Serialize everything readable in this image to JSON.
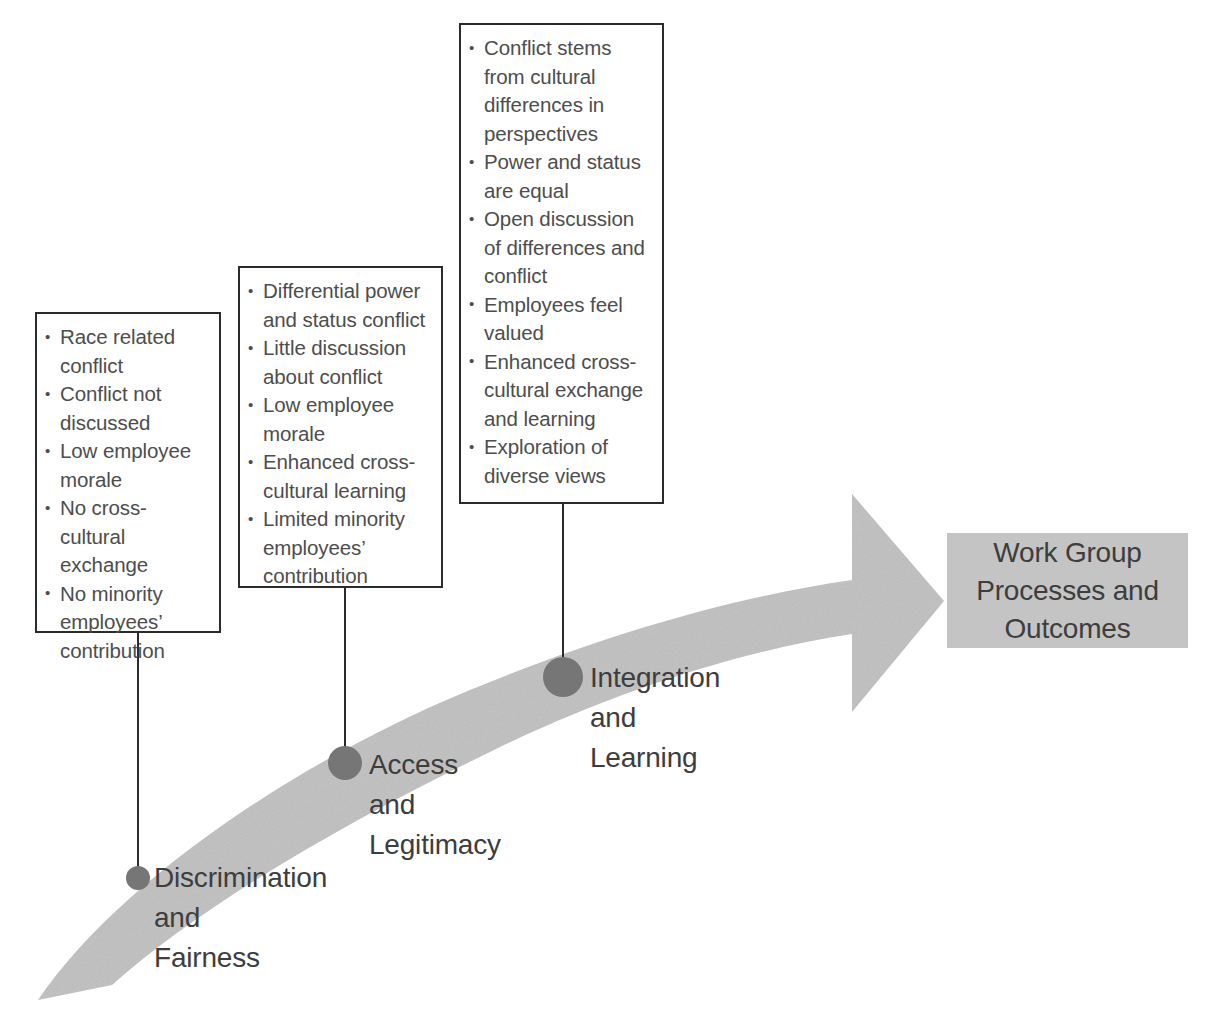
{
  "diagram": {
    "arrow": {
      "name": "curved-progress-arrow",
      "color": "#c4c4c4",
      "direction": "bottom-left to right, ascending"
    },
    "stages": [
      {
        "id": "discrimination-and-fairness",
        "label": "Discrimination\nand\nFairness",
        "dot_color": "#767676",
        "callout": {
          "items": [
            "Race related conflict",
            "Conflict not discussed",
            "Low employee morale",
            "No cross-cultural exchange",
            "No minority employees’ contribution"
          ]
        }
      },
      {
        "id": "access-and-legitimacy",
        "label": "Access\nand\nLegitimacy",
        "dot_color": "#767676",
        "callout": {
          "items": [
            "Differential power and status conflict",
            "Little discussion about conflict",
            "Low employee morale",
            "Enhanced cross-cultural learning",
            "Limited minority employees’ contribution"
          ]
        }
      },
      {
        "id": "integration-and-learning",
        "label": "Integration\nand\nLearning",
        "dot_color": "#767676",
        "callout": {
          "items": [
            "Conflict stems from cultural differences in perspectives",
            "Power and status are equal",
            "Open discussion of differences and conflict",
            "Employees feel valued",
            "Enhanced cross-cultural exchange and learning",
            "Exploration of diverse views"
          ]
        }
      }
    ],
    "outcome": {
      "id": "work-group-outcome",
      "label": "Work Group\nProcesses and\nOutcomes",
      "background": "#c4c4c4"
    }
  }
}
